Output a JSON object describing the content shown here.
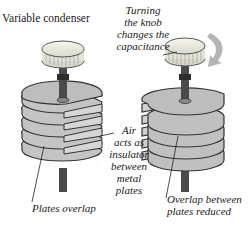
{
  "title": "Variable condenser",
  "labels": {
    "knob": [
      "Turning",
      "the knob",
      "changes the",
      "capacitance"
    ],
    "air": [
      "Air",
      "acts as",
      "insulator",
      "between",
      "metal",
      "plates"
    ],
    "overlap_left": "Plates overlap",
    "overlap_right": [
      "Overlap between",
      "plates reduced"
    ]
  },
  "colors": {
    "plate_fill": "#c8c8c8",
    "plate_edge": "#3a3a3a",
    "shaft": "#4a4a4a",
    "knob": "#efefe6",
    "arrow": "#b0b0b0"
  }
}
